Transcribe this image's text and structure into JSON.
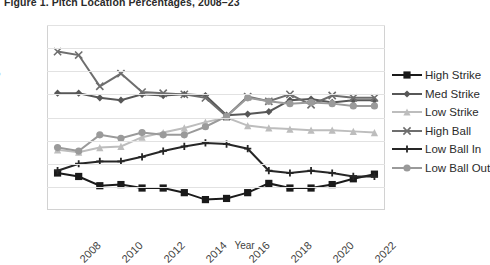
{
  "figure": {
    "title": "Figure 1. Pitch Location Percentages, 2008–23"
  },
  "axes": {
    "y_title": "Percentage",
    "x_title": "Year",
    "y_ticks": [
      "10",
      "12",
      "14",
      "16",
      "18",
      "20",
      "22",
      "24",
      "26"
    ],
    "x_ticks": [
      "2008",
      "2010",
      "2012",
      "2014",
      "2016",
      "2018",
      "2020",
      "2022"
    ]
  },
  "legend": {
    "position": "right",
    "items": [
      {
        "label": "High Strike",
        "marker": "square",
        "color": "#1a1a1a"
      },
      {
        "label": "Med Strike",
        "marker": "diamond",
        "color": "#575757"
      },
      {
        "label": "Low Strike",
        "marker": "triangle",
        "color": "#bdbdbd"
      },
      {
        "label": "High Ball",
        "marker": "cross-x",
        "color": "#6e6e6e"
      },
      {
        "label": "Low Ball In",
        "marker": "plus",
        "color": "#262626"
      },
      {
        "label": "Low Ball Out",
        "marker": "circle",
        "color": "#9a9a9a"
      }
    ]
  },
  "chart_data": {
    "type": "line",
    "title": "Figure 1. Pitch Location Percentages, 2008–23",
    "xlabel": "Year",
    "ylabel": "Percentage",
    "ylim": [
      10,
      26
    ],
    "ytick_step": 2,
    "grid": true,
    "legend_position": "right",
    "x": [
      2008,
      2009,
      2010,
      2011,
      2012,
      2013,
      2014,
      2015,
      2016,
      2017,
      2018,
      2019,
      2020,
      2021,
      2022,
      2023
    ],
    "series": [
      {
        "name": "High Strike",
        "color": "#1a1a1a",
        "marker": "square",
        "values": [
          13.2,
          12.9,
          12.1,
          12.2,
          11.9,
          11.9,
          11.5,
          10.9,
          11.0,
          11.5,
          12.3,
          11.9,
          11.9,
          12.2,
          12.7,
          13.1
        ]
      },
      {
        "name": "Med Strike",
        "color": "#575757",
        "marker": "diamond",
        "values": [
          20.1,
          20.1,
          19.7,
          19.5,
          20.0,
          19.9,
          20.0,
          19.9,
          18.2,
          18.3,
          18.5,
          19.5,
          19.6,
          19.3,
          19.5,
          19.5
        ]
      },
      {
        "name": "Low Strike",
        "color": "#bdbdbd",
        "marker": "triangle",
        "values": [
          15.2,
          15.0,
          15.4,
          15.5,
          16.3,
          16.7,
          17.1,
          17.6,
          18.0,
          17.3,
          17.1,
          17.0,
          16.9,
          16.9,
          16.8,
          16.7
        ]
      },
      {
        "name": "High Ball",
        "color": "#6e6e6e",
        "marker": "cross-x",
        "values": [
          23.7,
          23.4,
          20.7,
          21.8,
          20.2,
          20.1,
          20.0,
          19.7,
          18.1,
          19.8,
          19.4,
          20.0,
          19.1,
          19.9,
          19.7,
          19.7
        ]
      },
      {
        "name": "Low Ball In",
        "color": "#262626",
        "marker": "plus",
        "values": [
          13.4,
          14.0,
          14.2,
          14.2,
          14.6,
          15.1,
          15.5,
          15.8,
          15.7,
          15.3,
          13.4,
          13.2,
          13.4,
          13.2,
          12.9,
          12.9
        ]
      },
      {
        "name": "Low Ball Out",
        "color": "#9a9a9a",
        "marker": "circle",
        "values": [
          15.4,
          15.1,
          16.5,
          16.2,
          16.7,
          16.5,
          16.5,
          17.2,
          18.1,
          19.7,
          19.4,
          19.2,
          19.3,
          19.2,
          19.0,
          19.0
        ]
      }
    ]
  }
}
